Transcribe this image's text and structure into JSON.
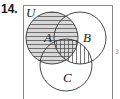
{
  "problem": {
    "number": "14."
  },
  "diagram": {
    "type": "venn",
    "universe_label": "U",
    "sets": [
      {
        "label": "A",
        "cx": 52,
        "cy": 38,
        "r": 26
      },
      {
        "label": "B",
        "cx": 80,
        "cy": 38,
        "r": 26
      },
      {
        "label": "C",
        "cx": 66,
        "cy": 65,
        "r": 26
      }
    ],
    "shading": {
      "horizontal_hatch": "A",
      "vertical_hatch": "B ∩ C",
      "fill_color": "#d9d9d9",
      "line_color": "#555555"
    }
  },
  "margin_mark": "3"
}
